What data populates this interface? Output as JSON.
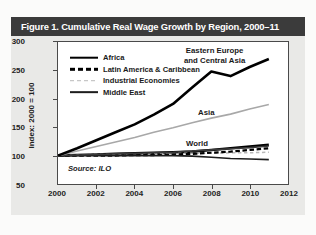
{
  "figure": {
    "title": "Figure 1. Cumulative Real Wage Growth by Region, 2000–11",
    "source": "Source: ILO",
    "header_color": "#3b3b3b",
    "card_color": "#e9e9e7"
  },
  "legend": {
    "position": "inside-top-left",
    "items": [
      {
        "label": "Africa",
        "style": "solid-thick",
        "color": "#000000"
      },
      {
        "label": "Latin America & Caribbean",
        "style": "dashed",
        "color": "#000000"
      },
      {
        "label": "Industrial Economies",
        "style": "dotted",
        "color": "#b9b9b9"
      },
      {
        "label": "Middle East",
        "style": "solid",
        "color": "#1d1d1d"
      }
    ]
  },
  "annotations": [
    {
      "name": "eastern-europe",
      "line1": "Eastern Europe",
      "line2": "and Central Asia"
    },
    {
      "name": "asia",
      "line1": "Asia",
      "line2": ""
    },
    {
      "name": "world",
      "line1": "World",
      "line2": ""
    }
  ],
  "chart_data": {
    "type": "line",
    "title": "Figure 1. Cumulative Real Wage Growth by Region, 2000–11",
    "xlabel": "",
    "ylabel": "Index: 2000 = 100",
    "xlim": [
      2000,
      2012
    ],
    "ylim": [
      50,
      300
    ],
    "xticks": [
      2000,
      2002,
      2004,
      2006,
      2008,
      2010,
      2012
    ],
    "yticks": [
      50,
      100,
      150,
      200,
      250,
      300
    ],
    "grid": false,
    "legend_position": "upper-left-inside",
    "x": [
      2000,
      2001,
      2002,
      2003,
      2004,
      2005,
      2006,
      2007,
      2008,
      2009,
      2010,
      2011
    ],
    "series": [
      {
        "name": "Eastern Europe and Central Asia",
        "style": "solid-thick",
        "color": "#000000",
        "labeled_on_plot": true,
        "values": [
          100,
          113,
          127,
          141,
          155,
          172,
          191,
          220,
          248,
          240,
          256,
          270
        ]
      },
      {
        "name": "Asia",
        "style": "solid",
        "color": "#a8a8a8",
        "labeled_on_plot": true,
        "values": [
          100,
          108,
          116,
          124,
          132,
          141,
          149,
          158,
          166,
          173,
          182,
          190
        ]
      },
      {
        "name": "Africa",
        "style": "solid-thick",
        "color": "#000000",
        "labeled_on_plot": false,
        "values": [
          100,
          101,
          102,
          103,
          104,
          105,
          106,
          107,
          110,
          113,
          116,
          119
        ]
      },
      {
        "name": "World",
        "style": "solid",
        "color": "#3a3a3a",
        "labeled_on_plot": true,
        "values": [
          100,
          101,
          102,
          103,
          104,
          105,
          106,
          108,
          110,
          112,
          114,
          117
        ]
      },
      {
        "name": "Latin America & Caribbean",
        "style": "dashed",
        "color": "#000000",
        "labeled_on_plot": false,
        "values": [
          100,
          100,
          100,
          100,
          101,
          101,
          102,
          103,
          105,
          107,
          110,
          113
        ]
      },
      {
        "name": "Industrial Economies",
        "style": "dotted",
        "color": "#b9b9b9",
        "labeled_on_plot": false,
        "values": [
          100,
          101,
          102,
          102,
          103,
          103,
          104,
          104,
          104,
          105,
          105,
          106
        ]
      },
      {
        "name": "Middle East",
        "style": "solid",
        "color": "#1d1d1d",
        "labeled_on_plot": false,
        "values": [
          100,
          100,
          100,
          100,
          100,
          100,
          100,
          99,
          97,
          95,
          94,
          93
        ]
      }
    ]
  }
}
